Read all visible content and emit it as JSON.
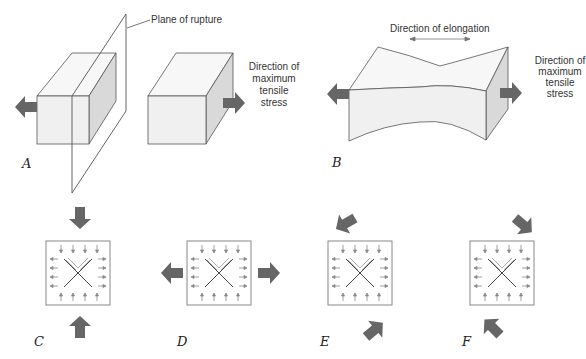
{
  "diagram": {
    "labels": {
      "plane_of_rupture": "Plane of rupture",
      "direction_elongation": "Direction of elongation",
      "direction_A_line1": "Direction of",
      "direction_A_line2": "maximum",
      "direction_A_line3": "tensile",
      "direction_A_line4": "stress",
      "direction_B_line1": "Direction of",
      "direction_B_line2": "maximum",
      "direction_B_line3": "tensile",
      "direction_B_line4": "stress"
    },
    "panels": {
      "A": "A",
      "B": "B",
      "C": "C",
      "D": "D",
      "E": "E",
      "F": "F"
    },
    "colors": {
      "arrow": "#666666",
      "block_front": "#f0f0f0",
      "block_side": "#d9d9d9",
      "block_top": "#f7f7f7",
      "outline": "#555555"
    }
  }
}
